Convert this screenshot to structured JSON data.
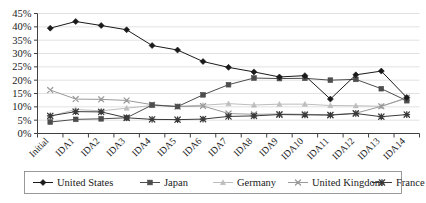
{
  "chart_data": {
    "type": "line",
    "title": "",
    "xlabel": "",
    "ylabel": "",
    "grid": true,
    "legend_position": "bottom",
    "ylim": [
      0,
      45
    ],
    "ytick_labels": [
      "0%",
      "5%",
      "10%",
      "15%",
      "20%",
      "25%",
      "30%",
      "35%",
      "40%",
      "45%"
    ],
    "ytick_values": [
      0,
      5,
      10,
      15,
      20,
      25,
      30,
      35,
      40,
      45
    ],
    "categories": [
      "Initial",
      "IDA1",
      "IDA2",
      "IDA3",
      "IDA4",
      "IDA5",
      "IDA6",
      "IDA7",
      "IDA8",
      "IDA9",
      "IDA10",
      "IDA11",
      "IDA12",
      "IDA13",
      "IDA14"
    ],
    "series": [
      {
        "name": "United States",
        "marker": "diamond",
        "color": "#1a1a1a",
        "values": [
          39.5,
          42.0,
          40.5,
          38.9,
          33.0,
          31.3,
          27.0,
          24.8,
          23.1,
          21.2,
          21.7,
          12.9,
          22.0,
          23.4,
          13.5
        ]
      },
      {
        "name": "Japan",
        "marker": "square",
        "color": "#4d4d4d",
        "values": [
          4.3,
          5.3,
          5.5,
          5.9,
          10.7,
          10.1,
          14.5,
          18.3,
          20.8,
          20.6,
          20.7,
          20.0,
          20.3,
          16.8,
          12.3
        ]
      },
      {
        "name": "Germany",
        "marker": "triangle",
        "color": "#bdbdbd",
        "values": [
          6.5,
          9.0,
          8.5,
          9.5,
          10.5,
          10.2,
          10.6,
          11.2,
          10.7,
          11.0,
          11.0,
          10.5,
          10.4,
          10.2,
          13.2
        ]
      },
      {
        "name": "United Kingdom",
        "marker": "cross",
        "color": "#9a9a9a",
        "values": [
          16.3,
          12.9,
          12.8,
          12.4,
          10.8,
          10.1,
          10.3,
          7.5,
          7.2,
          7.3,
          7.2,
          7.0,
          7.6,
          10.2,
          13.4
        ]
      },
      {
        "name": "France",
        "marker": "star",
        "color": "#3a3a3a",
        "values": [
          6.6,
          8.2,
          8.1,
          5.9,
          5.3,
          5.2,
          5.4,
          6.4,
          6.6,
          7.1,
          7.0,
          6.9,
          7.5,
          6.3,
          7.1
        ]
      }
    ]
  },
  "colors": {
    "axis": "#404040",
    "grid": "#d9d9d9",
    "text": "#1a1a1a",
    "legend_border": "#808080",
    "background": "#ffffff"
  }
}
